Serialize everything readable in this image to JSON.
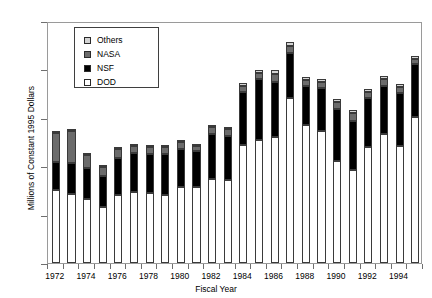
{
  "chart_data": {
    "type": "bar",
    "stacked": true,
    "title": "",
    "xlabel": "Fiscal Year",
    "ylabel": "Millions of Constant 1995 Dollars",
    "ylim": [
      0,
      250
    ],
    "ytick_values": [
      0,
      50,
      100,
      150,
      200,
      250
    ],
    "ytick_labels": [
      "0",
      "50",
      "100",
      "150",
      "200",
      "250"
    ],
    "grid": false,
    "legend_position": "upper-left-inside",
    "categories": [
      1972,
      1973,
      1974,
      1975,
      1976,
      1977,
      1978,
      1979,
      1980,
      1981,
      1982,
      1983,
      1984,
      1985,
      1986,
      1987,
      1988,
      1989,
      1990,
      1991,
      1992,
      1993,
      1994,
      1995
    ],
    "xtick_labels": [
      "1972",
      "1974",
      "1976",
      "1978",
      "1980",
      "1982",
      "1984",
      "1986",
      "1988",
      "1990",
      "1992",
      "1994"
    ],
    "xtick_years": [
      1972,
      1974,
      1976,
      1978,
      1980,
      1982,
      1984,
      1986,
      1988,
      1990,
      1992,
      1994
    ],
    "series": [
      {
        "name": "DOD",
        "color": "#ffffff",
        "values": [
          75,
          71,
          66,
          58,
          70,
          73,
          72,
          70,
          78,
          79,
          87,
          86,
          122,
          127,
          130,
          170,
          143,
          136,
          105,
          96,
          120,
          133,
          121,
          151
        ]
      },
      {
        "name": "NSF",
        "color": "#000000",
        "values": [
          29,
          32,
          32,
          32,
          38,
          41,
          41,
          43,
          40,
          37,
          46,
          45,
          55,
          63,
          57,
          47,
          40,
          45,
          54,
          51,
          50,
          50,
          55,
          55
        ]
      },
      {
        "name": "NASA",
        "color": "#6b6b6b",
        "values": [
          30,
          33,
          14,
          9,
          10,
          7,
          7,
          7,
          7,
          5,
          7,
          7,
          6,
          6,
          8,
          7,
          6,
          6,
          7,
          8,
          7,
          7,
          6,
          5
        ]
      },
      {
        "name": "Others",
        "color": "#d4d4d4",
        "values": [
          2,
          2,
          2,
          2,
          2,
          2,
          2,
          2,
          2,
          2,
          3,
          3,
          3,
          3,
          4,
          4,
          3,
          3,
          3,
          3,
          3,
          3,
          3,
          3
        ]
      }
    ],
    "totals": [
      136,
      138,
      114,
      101,
      120,
      123,
      122,
      122,
      127,
      123,
      143,
      141,
      186,
      199,
      199,
      228,
      192,
      190,
      169,
      158,
      180,
      193,
      185,
      214
    ]
  },
  "legend": {
    "entries": [
      {
        "label": "Others",
        "color": "#d4d4d4"
      },
      {
        "label": "NASA",
        "color": "#6b6b6b"
      },
      {
        "label": "NSF",
        "color": "#000000"
      },
      {
        "label": "DOD",
        "color": "#ffffff"
      }
    ]
  }
}
